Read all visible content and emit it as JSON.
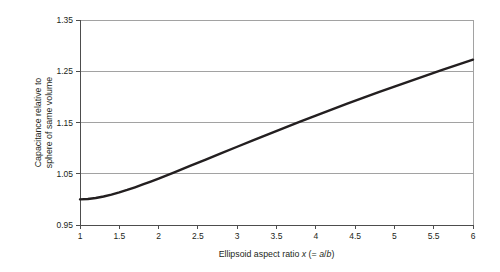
{
  "chart_data": {
    "type": "line",
    "title": "",
    "subtitle": "",
    "xlabel_parts": [
      {
        "text": "Ellipsoid aspect ratio ",
        "italic": false
      },
      {
        "text": "x",
        "italic": true
      },
      {
        "text": " (= ",
        "italic": false
      },
      {
        "text": "a",
        "italic": true
      },
      {
        "text": "/",
        "italic": false
      },
      {
        "text": "b",
        "italic": true
      },
      {
        "text": ")",
        "italic": false
      }
    ],
    "xlabel": "Ellipsoid aspect ratio x (= a/b)",
    "ylabel_line1": "Capacitance relative to",
    "ylabel_line2": "sphere of same volume",
    "ylabel": "Capacitance relative to sphere of same volume",
    "xlim": [
      1,
      6
    ],
    "ylim": [
      0.95,
      1.35
    ],
    "xticks": [
      1,
      1.5,
      2,
      2.5,
      3,
      3.5,
      4,
      4.5,
      5,
      5.5,
      6
    ],
    "xtick_labels": [
      "1",
      "1.5",
      "2",
      "2.5",
      "3",
      "3.5",
      "4",
      "4.5",
      "5",
      "5.5",
      "6"
    ],
    "yticks": [
      0.95,
      1.05,
      1.15,
      1.25,
      1.35
    ],
    "ytick_labels": [
      "0.95",
      "1.05",
      "1.15",
      "1.25",
      "1.35"
    ],
    "grid": {
      "horizontal": true,
      "vertical": false
    },
    "legend": null,
    "series": [
      {
        "name": "Capacitance ratio",
        "color": "#231f20",
        "line_width": 2.4,
        "x": [
          1.0,
          1.1,
          1.2,
          1.3,
          1.4,
          1.5,
          1.6,
          1.7,
          1.8,
          1.9,
          2.0,
          2.2,
          2.4,
          2.6,
          2.8,
          3.0,
          3.2,
          3.4,
          3.6,
          3.8,
          4.0,
          4.2,
          4.4,
          4.6,
          4.8,
          5.0,
          5.2,
          5.4,
          5.6,
          5.8,
          6.0
        ],
        "y": [
          1.0,
          1.0008,
          1.0027,
          1.0056,
          1.0093,
          1.0136,
          1.0184,
          1.0236,
          1.0291,
          1.0348,
          1.0407,
          1.0528,
          1.0652,
          1.0777,
          1.0902,
          1.1027,
          1.1151,
          1.1274,
          1.1396,
          1.1516,
          1.1634,
          1.1751,
          1.1866,
          1.1979,
          1.2091,
          1.2201,
          1.2309,
          1.2416,
          1.2521,
          1.2624,
          1.2726
        ]
      }
    ],
    "annotations": []
  },
  "plot_geometry": {
    "left": 80,
    "right": 473,
    "top": 20,
    "bottom": 225
  }
}
